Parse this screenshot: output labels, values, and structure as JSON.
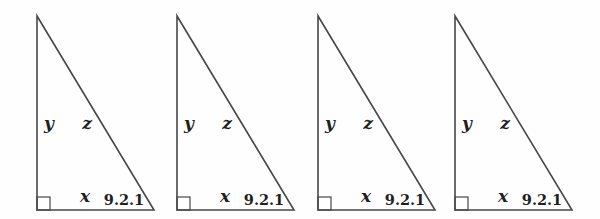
{
  "figure": {
    "background_color": "#fefefe",
    "line_color": "#474747",
    "label_color": "#1f1f1f",
    "triangles": [
      {
        "left_label": "y",
        "hypotenuse_label": "z",
        "base_label": "x",
        "figure_number": "9.2.1"
      },
      {
        "left_label": "y",
        "hypotenuse_label": "z",
        "base_label": "x",
        "figure_number": "9.2.1"
      },
      {
        "left_label": "y",
        "hypotenuse_label": "z",
        "base_label": "x",
        "figure_number": "9.2.1"
      },
      {
        "left_label": "y",
        "hypotenuse_label": "z",
        "base_label": "x",
        "figure_number": "9.2.1"
      }
    ]
  }
}
